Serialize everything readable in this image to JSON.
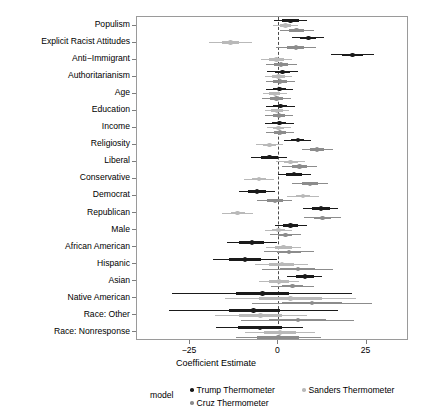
{
  "chart_data": {
    "type": "scatter",
    "title": "",
    "xlabel": "Coefficient Estimate",
    "ylabel": "",
    "xlim": [
      -40,
      37
    ],
    "xticks": [
      -25,
      0,
      25
    ],
    "xticklabels": [
      "−25",
      "0",
      "25"
    ],
    "grid": false,
    "zero_reference_line": 0,
    "legend_title": "model",
    "legend_position": "bottom",
    "categories": [
      "Populism",
      "Explicit Racist Attitudes",
      "Anti−Immigrant",
      "Authoritarianism",
      "Age",
      "Education",
      "Income",
      "Religiosity",
      "Liberal",
      "Conservative",
      "Democrat",
      "Republican",
      "Male",
      "African American",
      "Hispanic",
      "Asian",
      "Native American",
      "Race: Other",
      "Race: Nonresponse"
    ],
    "series": [
      {
        "name": "Trump Thermometer",
        "color": "#1a1a1a",
        "estimates": [
          3.4,
          8.5,
          21.0,
          1.2,
          0.3,
          0.6,
          0.3,
          5.5,
          -2.5,
          4.5,
          -6.0,
          12.0,
          3.5,
          -7.5,
          -9.5,
          7.5,
          -4.5,
          -7.0,
          -5.2
        ],
        "ci_inner": [
          [
            1.0,
            5.8
          ],
          [
            6.2,
            10.6
          ],
          [
            18.0,
            24.0
          ],
          [
            -1.0,
            3.2
          ],
          [
            -1.6,
            2.2
          ],
          [
            -1.4,
            2.6
          ],
          [
            -1.7,
            2.3
          ],
          [
            3.6,
            7.4
          ],
          [
            -5.0,
            0.0
          ],
          [
            2.2,
            6.8
          ],
          [
            -8.5,
            -3.5
          ],
          [
            9.5,
            14.5
          ],
          [
            1.3,
            5.7
          ],
          [
            -11.0,
            -4.0
          ],
          [
            -14.0,
            -5.0
          ],
          [
            5.0,
            10.0
          ],
          [
            -12.0,
            3.0
          ],
          [
            -14.0,
            0.5
          ],
          [
            -11.5,
            1.0
          ]
        ],
        "ci_outer": [
          [
            -1.2,
            8.0
          ],
          [
            4.0,
            13.0
          ],
          [
            15.0,
            27.0
          ],
          [
            -3.2,
            5.6
          ],
          [
            -3.6,
            4.2
          ],
          [
            -3.4,
            4.6
          ],
          [
            -3.8,
            4.4
          ],
          [
            1.6,
            9.4
          ],
          [
            -7.6,
            2.6
          ],
          [
            -0.2,
            9.2
          ],
          [
            -11.0,
            -1.0
          ],
          [
            7.0,
            17.0
          ],
          [
            -1.0,
            8.0
          ],
          [
            -14.5,
            -0.5
          ],
          [
            -18.5,
            -0.5
          ],
          [
            2.5,
            12.5
          ],
          [
            -30.0,
            21.0
          ],
          [
            -31.0,
            17.0
          ],
          [
            -17.5,
            7.0
          ]
        ]
      },
      {
        "name": "Sanders Thermometer",
        "color": "#b9b9b9",
        "estimates": [
          2.0,
          -13.5,
          -0.5,
          0.0,
          -1.0,
          -0.4,
          0.1,
          -2.5,
          3.5,
          -5.5,
          7.0,
          -11.5,
          0.0,
          1.5,
          1.0,
          0.2,
          3.5,
          -5.0,
          0.5
        ],
        "ci_inner": [
          [
            0.4,
            3.6
          ],
          [
            -16.0,
            -11.0
          ],
          [
            -2.5,
            1.5
          ],
          [
            -1.8,
            1.8
          ],
          [
            -2.6,
            0.6
          ],
          [
            -2.0,
            1.2
          ],
          [
            -1.5,
            1.7
          ],
          [
            -4.3,
            -0.7
          ],
          [
            1.5,
            5.5
          ],
          [
            -7.5,
            -3.5
          ],
          [
            5.0,
            9.0
          ],
          [
            -13.5,
            -9.5
          ],
          [
            -1.8,
            1.8
          ],
          [
            -1.0,
            4.0
          ],
          [
            -2.5,
            4.5
          ],
          [
            -2.5,
            2.9
          ],
          [
            -5.5,
            12.5
          ],
          [
            -11.0,
            1.0
          ],
          [
            -4.0,
            5.0
          ]
        ],
        "ci_outer": [
          [
            -1.5,
            5.5
          ],
          [
            -19.5,
            -7.5
          ],
          [
            -4.8,
            3.8
          ],
          [
            -3.8,
            3.8
          ],
          [
            -4.4,
            2.4
          ],
          [
            -3.8,
            3.0
          ],
          [
            -3.3,
            3.5
          ],
          [
            -6.3,
            1.3
          ],
          [
            -0.7,
            7.7
          ],
          [
            -9.8,
            -1.2
          ],
          [
            2.6,
            11.4
          ],
          [
            -15.8,
            -7.2
          ],
          [
            -3.8,
            3.8
          ],
          [
            -3.5,
            6.5
          ],
          [
            -6.5,
            8.5
          ],
          [
            -5.5,
            5.9
          ],
          [
            -15.0,
            22.0
          ],
          [
            -18.0,
            8.0
          ],
          [
            -9.5,
            10.5
          ]
        ]
      },
      {
        "name": "Cruz Thermometer",
        "color": "#8c8c8c",
        "estimates": [
          5.2,
          5.0,
          0.8,
          0.5,
          -0.5,
          0.2,
          0.5,
          11.0,
          6.0,
          9.0,
          -1.0,
          12.5,
          2.0,
          3.0,
          5.5,
          4.0,
          9.5,
          5.5,
          0.0
        ],
        "ci_inner": [
          [
            3.0,
            7.4
          ],
          [
            2.6,
            7.4
          ],
          [
            -1.2,
            2.8
          ],
          [
            -1.4,
            2.4
          ],
          [
            -2.3,
            1.3
          ],
          [
            -1.6,
            2.0
          ],
          [
            -1.3,
            2.3
          ],
          [
            9.0,
            13.0
          ],
          [
            3.8,
            8.2
          ],
          [
            6.8,
            11.2
          ],
          [
            -3.2,
            1.2
          ],
          [
            10.0,
            15.0
          ],
          [
            0.0,
            4.0
          ],
          [
            -0.5,
            6.5
          ],
          [
            0.5,
            10.5
          ],
          [
            1.0,
            7.0
          ],
          [
            1.0,
            18.0
          ],
          [
            -2.5,
            13.5
          ],
          [
            -6.0,
            6.0
          ]
        ],
        "ci_outer": [
          [
            0.4,
            10.0
          ],
          [
            -0.6,
            10.6
          ],
          [
            -3.6,
            5.2
          ],
          [
            -3.6,
            4.6
          ],
          [
            -4.5,
            3.5
          ],
          [
            -3.8,
            4.2
          ],
          [
            -3.5,
            4.5
          ],
          [
            6.6,
            15.4
          ],
          [
            1.0,
            11.0
          ],
          [
            4.0,
            14.0
          ],
          [
            -6.0,
            4.0
          ],
          [
            7.2,
            17.8
          ],
          [
            -2.4,
            6.4
          ],
          [
            -4.0,
            10.0
          ],
          [
            -4.5,
            15.5
          ],
          [
            -2.0,
            10.0
          ],
          [
            -7.5,
            26.5
          ],
          [
            -10.5,
            21.5
          ],
          [
            -12.0,
            12.0
          ]
        ]
      }
    ]
  },
  "legend": {
    "title": "model",
    "entries": [
      {
        "label": "Trump Thermometer",
        "color": "#1a1a1a"
      },
      {
        "label": "Sanders Thermometer",
        "color": "#b9b9b9"
      },
      {
        "label": "Cruz Thermometer",
        "color": "#8c8c8c"
      }
    ]
  },
  "axes": {
    "x_title": "Coefficient Estimate"
  }
}
